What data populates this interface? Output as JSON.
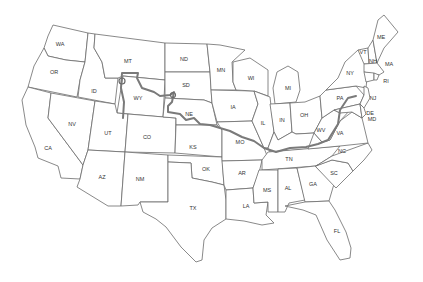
{
  "map": {
    "title": "Map of contiguous United States with highlighted route",
    "colors": {
      "background": "#ffffff",
      "state_fill": "#ffffff",
      "state_border": "#6b6b6b",
      "route": "#7a7a7a",
      "label": "#333333"
    },
    "states": [
      {
        "abbr": "WA",
        "x": 60,
        "y": 45
      },
      {
        "abbr": "OR",
        "x": 54,
        "y": 73
      },
      {
        "abbr": "CA",
        "x": 48,
        "y": 149
      },
      {
        "abbr": "NV",
        "x": 72,
        "y": 125
      },
      {
        "abbr": "ID",
        "x": 94,
        "y": 92
      },
      {
        "abbr": "MT",
        "x": 128,
        "y": 62
      },
      {
        "abbr": "WY",
        "x": 138,
        "y": 99
      },
      {
        "abbr": "UT",
        "x": 108,
        "y": 134
      },
      {
        "abbr": "CO",
        "x": 147,
        "y": 138
      },
      {
        "abbr": "AZ",
        "x": 102,
        "y": 178
      },
      {
        "abbr": "NM",
        "x": 140,
        "y": 180
      },
      {
        "abbr": "ND",
        "x": 184,
        "y": 60
      },
      {
        "abbr": "SD",
        "x": 186,
        "y": 86
      },
      {
        "abbr": "NE",
        "x": 189,
        "y": 115
      },
      {
        "abbr": "KS",
        "x": 193,
        "y": 148
      },
      {
        "abbr": "OK",
        "x": 206,
        "y": 170
      },
      {
        "abbr": "TX",
        "x": 193,
        "y": 209
      },
      {
        "abbr": "MN",
        "x": 221,
        "y": 71
      },
      {
        "abbr": "IA",
        "x": 233,
        "y": 108
      },
      {
        "abbr": "MO",
        "x": 240,
        "y": 143
      },
      {
        "abbr": "AR",
        "x": 242,
        "y": 174
      },
      {
        "abbr": "LA",
        "x": 246,
        "y": 207
      },
      {
        "abbr": "WI",
        "x": 251,
        "y": 79
      },
      {
        "abbr": "IL",
        "x": 263,
        "y": 124
      },
      {
        "abbr": "MI",
        "x": 288,
        "y": 89
      },
      {
        "abbr": "IN",
        "x": 282,
        "y": 121
      },
      {
        "abbr": "OH",
        "x": 304,
        "y": 116
      },
      {
        "abbr": "KY",
        "x": 298,
        "y": 137
      },
      {
        "abbr": "TN",
        "x": 289,
        "y": 160
      },
      {
        "abbr": "MS",
        "x": 267,
        "y": 191
      },
      {
        "abbr": "AL",
        "x": 288,
        "y": 189
      },
      {
        "abbr": "GA",
        "x": 313,
        "y": 185
      },
      {
        "abbr": "FL",
        "x": 337,
        "y": 232
      },
      {
        "abbr": "SC",
        "x": 334,
        "y": 174
      },
      {
        "abbr": "NC",
        "x": 342,
        "y": 152
      },
      {
        "abbr": "VA",
        "x": 340,
        "y": 134
      },
      {
        "abbr": "WV",
        "x": 321,
        "y": 131
      },
      {
        "abbr": "PA",
        "x": 340,
        "y": 99
      },
      {
        "abbr": "NY",
        "x": 350,
        "y": 74
      },
      {
        "abbr": "VT",
        "x": 363,
        "y": 53
      },
      {
        "abbr": "NH",
        "x": 373,
        "y": 62
      },
      {
        "abbr": "ME",
        "x": 381,
        "y": 38
      },
      {
        "abbr": "MA",
        "x": 389,
        "y": 65
      },
      {
        "abbr": "RI",
        "x": 386,
        "y": 82
      },
      {
        "abbr": "NJ",
        "x": 373,
        "y": 99
      },
      {
        "abbr": "DE",
        "x": 370,
        "y": 114
      },
      {
        "abbr": "MD",
        "x": 372,
        "y": 120
      }
    ]
  }
}
